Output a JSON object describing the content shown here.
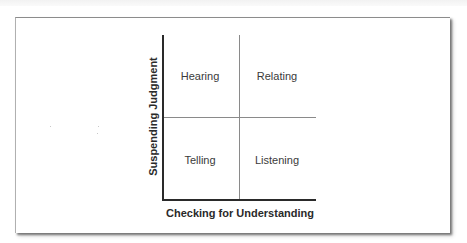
{
  "diagram": {
    "type": "2x2 quadrant matrix",
    "x_axis_label": "Checking for Understanding",
    "y_axis_label": "Suspending Judgment",
    "quadrants": {
      "top_left": "Hearing",
      "top_right": "Relating",
      "bottom_left": "Telling",
      "bottom_right": "Listening"
    }
  },
  "colors": {
    "axis": "#2a2a2a",
    "divider": "#8a8a8a",
    "text": "#3a3a3a",
    "background": "#ffffff",
    "frame_border": "#8c8c8c"
  }
}
